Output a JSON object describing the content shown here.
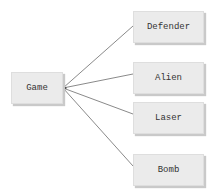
{
  "diagram": {
    "root": {
      "id": "game",
      "label": "Game",
      "x": 11,
      "y": 72,
      "w": 52,
      "h": 32
    },
    "children": [
      {
        "id": "defender",
        "label": "Defender",
        "x": 133,
        "y": 11,
        "w": 71,
        "h": 32
      },
      {
        "id": "alien",
        "label": "Alien",
        "x": 133,
        "y": 62,
        "w": 71,
        "h": 32
      },
      {
        "id": "laser",
        "label": "Laser",
        "x": 133,
        "y": 102,
        "w": 71,
        "h": 32
      },
      {
        "id": "bomb",
        "label": "Bomb",
        "x": 133,
        "y": 154,
        "w": 71,
        "h": 32
      }
    ],
    "edges": [
      {
        "from": "game",
        "to": "defender",
        "x1": 63,
        "y1": 88,
        "x2": 133,
        "y2": 26
      },
      {
        "from": "game",
        "to": "alien",
        "x1": 63,
        "y1": 88,
        "x2": 133,
        "y2": 74
      },
      {
        "from": "game",
        "to": "laser",
        "x1": 63,
        "y1": 88,
        "x2": 133,
        "y2": 114
      },
      {
        "from": "game",
        "to": "bomb",
        "x1": 63,
        "y1": 88,
        "x2": 133,
        "y2": 166
      }
    ],
    "colors": {
      "line": "#8a8a8a",
      "node_fill": "#ebebeb",
      "text": "#333333",
      "connector": "#333333"
    }
  }
}
